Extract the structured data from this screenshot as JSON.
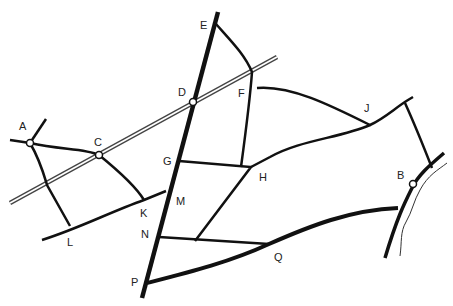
{
  "map": {
    "title": "Road network map",
    "colors": {
      "road": "#111111",
      "rail": "#444444",
      "river": "#333333",
      "background": "#ffffff"
    },
    "points": [
      {
        "id": "A",
        "label": "A",
        "x": 30,
        "y": 143,
        "lx": 19,
        "ly": 121,
        "station": true
      },
      {
        "id": "B",
        "label": "B",
        "x": 413,
        "y": 184,
        "lx": 397,
        "ly": 170,
        "station": true
      },
      {
        "id": "C",
        "label": "C",
        "x": 99,
        "y": 155,
        "lx": 94,
        "ly": 137,
        "station": true
      },
      {
        "id": "D",
        "label": "D",
        "x": 193,
        "y": 102,
        "lx": 178,
        "ly": 87,
        "station": true
      },
      {
        "id": "E",
        "label": "E",
        "x": 216,
        "y": 24,
        "lx": 200,
        "ly": 20,
        "station": false
      },
      {
        "id": "F",
        "label": "F",
        "x": 252,
        "y": 72,
        "lx": 238,
        "ly": 88,
        "station": false
      },
      {
        "id": "G",
        "label": "G",
        "x": 179,
        "y": 161,
        "lx": 163,
        "ly": 156,
        "station": false
      },
      {
        "id": "H",
        "label": "H",
        "x": 251,
        "y": 167,
        "lx": 259,
        "ly": 172,
        "station": false
      },
      {
        "id": "J",
        "label": "J",
        "x": 370,
        "y": 125,
        "lx": 364,
        "ly": 103,
        "station": false
      },
      {
        "id": "K",
        "label": "K",
        "x": 144,
        "y": 200,
        "lx": 140,
        "ly": 208,
        "station": false
      },
      {
        "id": "L",
        "label": "L",
        "x": 70,
        "y": 226,
        "lx": 67,
        "ly": 237,
        "station": false
      },
      {
        "id": "M",
        "label": "M",
        "x": 166,
        "y": 191,
        "lx": 176,
        "ly": 196,
        "station": false
      },
      {
        "id": "N",
        "label": "N",
        "x": 159,
        "y": 237,
        "lx": 141,
        "ly": 229,
        "station": false
      },
      {
        "id": "P",
        "label": "P",
        "x": 147,
        "y": 281,
        "lx": 131,
        "ly": 277,
        "station": false
      },
      {
        "id": "Q",
        "label": "Q",
        "x": 269,
        "y": 244,
        "lx": 274,
        "ly": 252,
        "station": false
      }
    ]
  }
}
